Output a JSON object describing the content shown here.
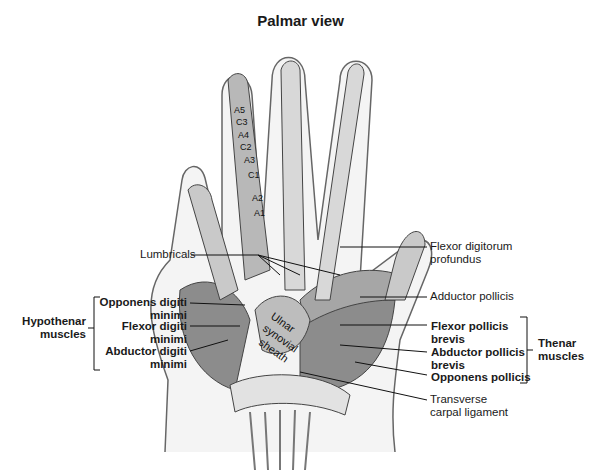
{
  "title": "Palmar view",
  "labels": {
    "lumbricals": "Lumbricals",
    "flexor_digitorum_profundus": [
      "Flexor digitorum",
      "profundus"
    ],
    "adductor_pollicis": "Adductor pollicis",
    "transverse_carpal_ligament": [
      "Transverse",
      "carpal ligament"
    ]
  },
  "hypothenar": {
    "group_label": [
      "Hypothenar",
      "muscles"
    ],
    "items": [
      {
        "lines": [
          "Opponens digiti",
          "minimi"
        ]
      },
      {
        "lines": [
          "Flexor digiti",
          "minimi"
        ]
      },
      {
        "lines": [
          "Abductor digiti",
          "minimi"
        ]
      }
    ]
  },
  "thenar": {
    "group_label": [
      "Thenar",
      "muscles"
    ],
    "items": [
      {
        "lines": [
          "Flexor pollicis",
          "brevis"
        ]
      },
      {
        "lines": [
          "Abductor pollicis",
          "brevis"
        ]
      },
      {
        "lines": [
          "Opponens pollicis"
        ]
      }
    ]
  },
  "pulleys": [
    "A5",
    "C3",
    "A4",
    "C2",
    "A3",
    "C1",
    "A2",
    "A1"
  ],
  "sheath_label": [
    "Ulnar",
    "synovial",
    "sheath"
  ],
  "colors": {
    "outline": "#555555",
    "muscle": "#9a9a9a",
    "tendon": "#d8d8d8",
    "leader": "#111111"
  }
}
